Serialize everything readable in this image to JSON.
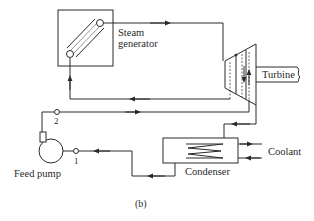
{
  "diagram": {
    "caption": "(b)",
    "components": {
      "steam_generator": {
        "label_line1": "Steam",
        "label_line2": "generator"
      },
      "turbine": {
        "label": "Turbine"
      },
      "condenser": {
        "label": "Condenser"
      },
      "feed_pump": {
        "label": "Feed pump"
      },
      "coolant": {
        "label": "Coolant"
      }
    },
    "state_points": [
      {
        "id": "1",
        "label": "1"
      },
      {
        "id": "2",
        "label": "2"
      }
    ],
    "colors": {
      "line": "#2a2a2a",
      "background": "#ffffff"
    }
  }
}
